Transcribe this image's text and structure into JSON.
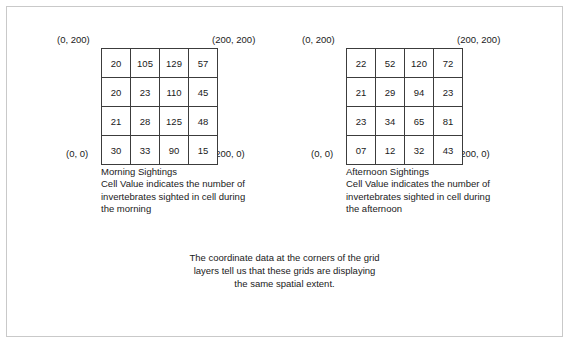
{
  "figure": {
    "border_color": "#c9c9c9",
    "background": "#ffffff",
    "grid_line_color": "#3c3c3c"
  },
  "panels": [
    {
      "id": "morning",
      "title": "Morning Sightings",
      "caption_lines": [
        "Cell Value indicates the number of",
        "invertebrates sighted in cell during",
        "the morning"
      ],
      "corners": {
        "top_left": "(0, 200)",
        "top_right": "(200, 200)",
        "bottom_left": "(0, 0)",
        "bottom_right": "(200, 0)"
      },
      "grid": [
        [
          "20",
          "105",
          "129",
          "57"
        ],
        [
          "20",
          "23",
          "110",
          "45"
        ],
        [
          "21",
          "28",
          "125",
          "48"
        ],
        [
          "30",
          "33",
          "90",
          "15"
        ]
      ]
    },
    {
      "id": "afternoon",
      "title": "Afternoon Sightings",
      "caption_lines": [
        "Cell Value indicates the number of",
        "invertebrates sighted in cell during",
        "the afternoon"
      ],
      "corners": {
        "top_left": "(0, 200)",
        "top_right": "(200, 200)",
        "bottom_left": "(0, 0)",
        "bottom_right": "(200, 0)"
      },
      "grid": [
        [
          "22",
          "52",
          "120",
          "72"
        ],
        [
          "21",
          "29",
          "94",
          "23"
        ],
        [
          "23",
          "34",
          "65",
          "81"
        ],
        [
          "07",
          "12",
          "32",
          "43"
        ]
      ]
    }
  ],
  "closing_note_lines": [
    "The coordinate data at the corners of the grid",
    "layers tell us that these grids are displaying",
    "the same spatial extent."
  ],
  "chart_data": {
    "type": "heatmap",
    "title": "",
    "xlabel": "",
    "ylabel": "",
    "xlim": [
      0,
      200
    ],
    "ylim": [
      0,
      200
    ],
    "grid": true,
    "legend": "none",
    "rows": 4,
    "cols": 4,
    "series": [
      {
        "name": "Morning Sightings",
        "values": [
          [
            20,
            105,
            129,
            57
          ],
          [
            20,
            23,
            110,
            45
          ],
          [
            21,
            28,
            125,
            48
          ],
          [
            30,
            33,
            90,
            15
          ]
        ]
      },
      {
        "name": "Afternoon Sightings",
        "values": [
          [
            22,
            52,
            120,
            72
          ],
          [
            21,
            29,
            94,
            23
          ],
          [
            23,
            34,
            65,
            81
          ],
          [
            7,
            12,
            32,
            43
          ]
        ]
      }
    ]
  }
}
